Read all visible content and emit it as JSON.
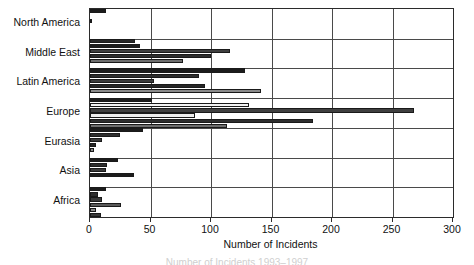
{
  "chart_data": {
    "type": "bar",
    "orientation": "horizontal",
    "title": "",
    "xlabel": "Number of Incidents",
    "ylabel": "",
    "xlim": [
      0,
      300
    ],
    "xticks": [
      0,
      50,
      100,
      150,
      200,
      250,
      300
    ],
    "grid": true,
    "legend": "none",
    "categories": [
      "North America",
      "Middle East",
      "Latin America",
      "Europe",
      "Eurasia",
      "Asia",
      "Africa"
    ],
    "groups": [
      {
        "category": "North America",
        "values": [
          13,
          0,
          2,
          0,
          0,
          0
        ],
        "shades": [
          "#1c1c1c",
          "#ffffff",
          "#3a3a3a",
          "#ffffff",
          "#ffffff",
          "#ffffff"
        ]
      },
      {
        "category": "Middle East",
        "values": [
          37,
          41,
          116,
          100,
          77,
          0
        ],
        "shades": [
          "#262626",
          "#1c1c1c",
          "#3f3f3f",
          "#2e2e2e",
          "#6e6e6e",
          "#ffffff"
        ]
      },
      {
        "category": "Latin America",
        "values": [
          128,
          90,
          53,
          95,
          141,
          0
        ],
        "shades": [
          "#1c1c1c",
          "#2e2e2e",
          "#3a3a3a",
          "#262626",
          "#8a8a8a",
          "#ffffff"
        ]
      },
      {
        "category": "Europe",
        "values": [
          51,
          131,
          268,
          87,
          184,
          113
        ],
        "shades": [
          "#1c1c1c",
          "#f2f2f2",
          "#3f3f3f",
          "#ededed",
          "#2e2e2e",
          "#6e6e6e"
        ]
      },
      {
        "category": "Eurasia",
        "values": [
          44,
          25,
          10,
          5,
          3,
          0
        ],
        "shades": [
          "#1c1c1c",
          "#2e2e2e",
          "#3a3a3a",
          "#262626",
          "#8a8a8a",
          "#ffffff"
        ]
      },
      {
        "category": "Asia",
        "values": [
          23,
          14,
          13,
          36,
          0,
          0
        ],
        "shades": [
          "#1c1c1c",
          "#2e2e2e",
          "#3a3a3a",
          "#1c1c1c",
          "#ffffff",
          "#ffffff"
        ]
      },
      {
        "category": "Africa",
        "values": [
          13,
          7,
          10,
          26,
          5,
          9
        ],
        "shades": [
          "#1c1c1c",
          "#2e2e2e",
          "#3a3a3a",
          "#5a5a5a",
          "#8a8a8a",
          "#3a3a3a"
        ]
      }
    ]
  },
  "axis": {
    "x_title": "Number of Incidents",
    "tick_labels": [
      "0",
      "50",
      "100",
      "150",
      "200",
      "250",
      "300"
    ]
  },
  "caption": {
    "text": "Number of Incidents 1993–1997"
  }
}
